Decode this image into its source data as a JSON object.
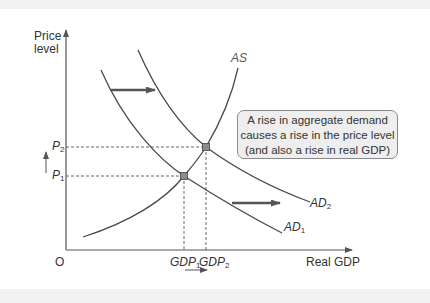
{
  "diagram": {
    "type": "aggregate-supply-demand",
    "axes": {
      "y_label_line1": "Price",
      "y_label_line2": "level",
      "x_label": "Real GDP",
      "origin": "O"
    },
    "curves": {
      "as": {
        "label": "AS"
      },
      "ad1": {
        "label": "AD",
        "sub": "1"
      },
      "ad2": {
        "label": "AD",
        "sub": "2"
      }
    },
    "price_levels": [
      {
        "label": "P",
        "sub": "2"
      },
      {
        "label": "P",
        "sub": "1"
      }
    ],
    "gdp_levels": [
      {
        "label": "GDP",
        "sub": "1"
      },
      {
        "label": "GDP",
        "sub": "2"
      }
    ],
    "callout": {
      "line1": "A rise in aggregate demand",
      "line2": "causes a rise in the price level",
      "line3": "(and also a rise in real GDP)"
    },
    "colors": {
      "curve": "#4a4a4a",
      "axis": "#555555",
      "point_fill": "#8c8c8c",
      "callout_bg": "#eeeeee",
      "arrow": "#555555"
    }
  }
}
